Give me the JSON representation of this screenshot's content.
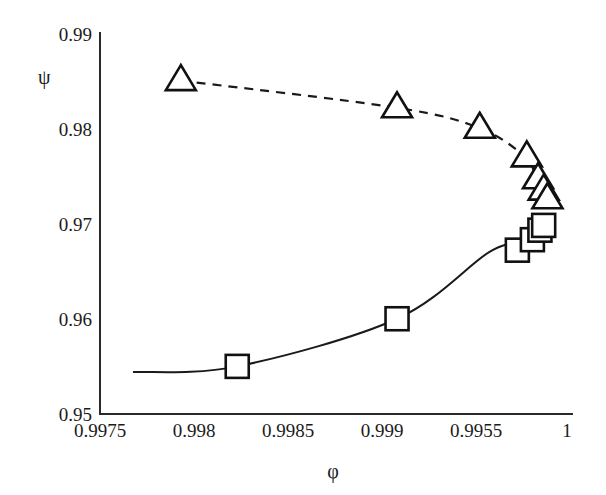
{
  "chart_data": {
    "type": "line",
    "title": "",
    "xlabel": "φ",
    "ylabel": "ψ",
    "xlim": [
      0.9975,
      1.0
    ],
    "ylim": [
      0.95,
      0.99
    ],
    "grid": false,
    "legend": "none",
    "x_tick_labels": [
      "0.9975",
      "0.998",
      "0.9985",
      "0.999",
      "0.9955",
      "1"
    ],
    "x_tick_values": [
      0.9975,
      0.998,
      0.9985,
      0.999,
      0.9995,
      1.0
    ],
    "y_tick_labels": [
      "0.95",
      "0.96",
      "0.97",
      "0.98",
      "0.99"
    ],
    "y_tick_values": [
      0.95,
      0.96,
      0.97,
      0.98,
      0.99
    ],
    "series": [
      {
        "name": "upper-branch",
        "marker": "triangle-open",
        "linestyle": "dashed",
        "x": [
          0.99793,
          0.99908,
          0.99952,
          0.99976,
          0.99982,
          0.99985,
          0.99987,
          0.99988
        ],
        "y": [
          0.985,
          0.98215,
          0.98,
          0.977,
          0.9748,
          0.9738,
          0.973,
          0.9725
        ],
        "marker_x": [
          0.99793,
          0.99908,
          0.99952,
          0.99977,
          0.99983,
          0.99986,
          0.99988
        ],
        "marker_y": [
          0.985,
          0.98215,
          0.98,
          0.977,
          0.9747,
          0.9735,
          0.9726
        ]
      },
      {
        "name": "lower-branch",
        "marker": "square-open",
        "linestyle": "solid",
        "x": [
          0.99768,
          0.99823,
          0.99908,
          0.99957,
          0.99975,
          0.99982,
          0.99985,
          0.99987
        ],
        "y": [
          0.9544,
          0.955,
          0.96,
          0.967,
          0.968,
          0.969,
          0.9695,
          0.97
        ],
        "marker_x": [
          0.99823,
          0.99908,
          0.99972,
          0.9998,
          0.99984,
          0.99986
        ],
        "marker_y": [
          0.955,
          0.96,
          0.9672,
          0.9683,
          0.9693,
          0.9698
        ]
      }
    ]
  }
}
